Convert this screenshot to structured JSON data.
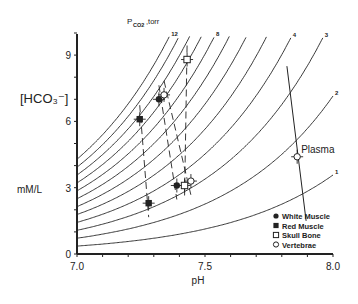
{
  "chart_data": {
    "type": "scatter",
    "title": "",
    "xlabel": "pH",
    "ylabel": "[HCO3-] mM/L",
    "ylabel_top": "[HCO₃⁻]",
    "ylabel_bottom": "mM/L",
    "xlim": [
      7.0,
      8.0
    ],
    "ylim": [
      0,
      10.2
    ],
    "x_ticks": [
      7.0,
      7.1,
      7.2,
      7.3,
      7.4,
      7.5,
      7.6,
      7.7,
      7.8,
      7.9,
      8.0
    ],
    "x_tick_labels": [
      "7.0",
      "7.5",
      "8.0"
    ],
    "x_tick_label_values": [
      7.0,
      7.5,
      8.0
    ],
    "y_ticks": [
      0,
      1,
      2,
      3,
      4,
      5,
      6,
      7,
      8,
      9,
      10
    ],
    "y_tick_labels": [
      "0",
      "3",
      "6",
      "9"
    ],
    "y_tick_label_values": [
      0,
      3,
      6,
      9
    ],
    "grid": false,
    "isopleth_title": "P",
    "isopleth_title_sub": "CO2",
    "isopleth_title_suffix": ",torr",
    "isopleths": {
      "coefficient": 0.045,
      "pK": 6.1,
      "pco2_values": [
        1,
        2,
        3,
        4,
        5,
        6,
        7,
        8,
        9,
        10,
        11,
        12
      ],
      "labeled": [
        {
          "value": 12,
          "label": "12"
        },
        {
          "value": 8,
          "label": "8"
        },
        {
          "value": 4,
          "label": "4"
        },
        {
          "value": 3,
          "label": "3"
        },
        {
          "value": 2,
          "label": "2"
        },
        {
          "value": 1,
          "label": "1"
        }
      ]
    },
    "series": [
      {
        "name": "White Muscle",
        "marker": "filled-circle",
        "points": [
          {
            "x": 7.32,
            "y": 7.0
          },
          {
            "x": 7.39,
            "y": 3.1
          }
        ]
      },
      {
        "name": "Red Muscle",
        "marker": "filled-square",
        "points": [
          {
            "x": 7.245,
            "y": 6.1
          },
          {
            "x": 7.28,
            "y": 2.3
          }
        ]
      },
      {
        "name": "Skull Bone",
        "marker": "open-square",
        "points": [
          {
            "x": 7.43,
            "y": 8.8
          },
          {
            "x": 7.42,
            "y": 3.1
          }
        ]
      },
      {
        "name": "Vertebrae",
        "marker": "open-circle",
        "points": [
          {
            "x": 7.34,
            "y": 7.2
          },
          {
            "x": 7.445,
            "y": 3.3
          }
        ]
      },
      {
        "name": "Plasma",
        "marker": "open-circle",
        "label": "Plasma",
        "points": [
          {
            "x": 7.86,
            "y": 4.4
          }
        ]
      }
    ],
    "dashed_links": [
      {
        "series": "Red Muscle",
        "from": [
          7.245,
          6.1
        ],
        "to": [
          7.28,
          2.3
        ]
      },
      {
        "series": "White Muscle",
        "from": [
          7.32,
          7.0
        ],
        "to": [
          7.39,
          3.1
        ]
      },
      {
        "series": "Vertebrae",
        "from": [
          7.34,
          7.2
        ],
        "to": [
          7.445,
          3.3
        ]
      },
      {
        "series": "Skull Bone",
        "from": [
          7.43,
          8.8
        ],
        "to": [
          7.42,
          3.1
        ]
      }
    ],
    "plasma_buffer_line": {
      "from": [
        7.83,
        6.6
      ],
      "to": [
        7.88,
        4.5
      ],
      "continue_to": [
        7.895,
        1.5
      ],
      "start": [
        7.82,
        8.5
      ]
    },
    "legend": {
      "position": "lower-right",
      "entries": [
        {
          "label": "White Muscle",
          "marker": "filled-circle"
        },
        {
          "label": "Red Muscle",
          "marker": "filled-square"
        },
        {
          "label": "Skull Bone",
          "marker": "open-square"
        },
        {
          "label": "Vertebrae",
          "marker": "open-circle"
        }
      ]
    },
    "colors": {
      "ink": "#222222",
      "background": "#ffffff"
    }
  }
}
